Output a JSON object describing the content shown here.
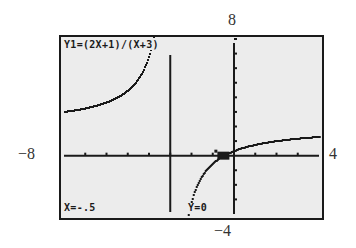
{
  "chart_data": {
    "type": "line",
    "title": "Y1=(2X+1)/(X+3)",
    "function": "(2x+1)/(x+3)",
    "window": {
      "xmin": -8,
      "xmax": 4,
      "ymin": -4,
      "ymax": 8,
      "xscl": 1,
      "yscl": 1
    },
    "xlim": [
      -8,
      4
    ],
    "ylim": [
      -4,
      8
    ],
    "vertical_asymptote_x": -3,
    "grid": false,
    "series": [
      {
        "name": "Y1",
        "branch": "left",
        "x": [
          -8,
          -7,
          -6,
          -5,
          -4.5,
          -4,
          -3.6,
          -3.4
        ],
        "y": [
          3,
          3.25,
          3.67,
          4.5,
          5.33,
          7,
          10.33,
          14.5
        ]
      },
      {
        "name": "Y1",
        "branch": "right",
        "x": [
          -2.65,
          -2.5,
          -2,
          -1.5,
          -1,
          -0.5,
          0,
          1,
          2,
          3,
          4
        ],
        "y": [
          -4.29,
          -3,
          -1,
          -0.67,
          0.5,
          0,
          0.33,
          0.75,
          1,
          1.17,
          1.29
        ]
      }
    ],
    "cursor": {
      "x": -0.5,
      "y": 0
    },
    "annotations": [
      "X=-.5",
      "Y=0"
    ]
  },
  "outer_labels": {
    "top": "8",
    "bottom": "−4",
    "left": "−8",
    "right": "4"
  },
  "screen": {
    "equation": "Y1=(2X+1)/(X+3)",
    "x_readout": "X=-.5",
    "y_readout": "Y=0"
  },
  "colors": {
    "lcd_background": "#ececec",
    "ink": "#1a1a1a"
  }
}
